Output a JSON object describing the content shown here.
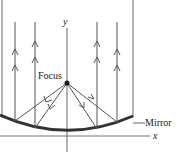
{
  "diagram": {
    "labels": {
      "y_axis": "y",
      "x_axis": "x",
      "focus": "Focus",
      "mirror": "Mirror"
    },
    "colors": {
      "line": "#555555",
      "mirror": "#333333",
      "focus_dot": "#111111"
    },
    "rays": [
      {
        "x": 15,
        "side": "left"
      },
      {
        "x": 35,
        "side": "left"
      },
      {
        "x": 97,
        "side": "right"
      },
      {
        "x": 117,
        "side": "right"
      }
    ]
  }
}
